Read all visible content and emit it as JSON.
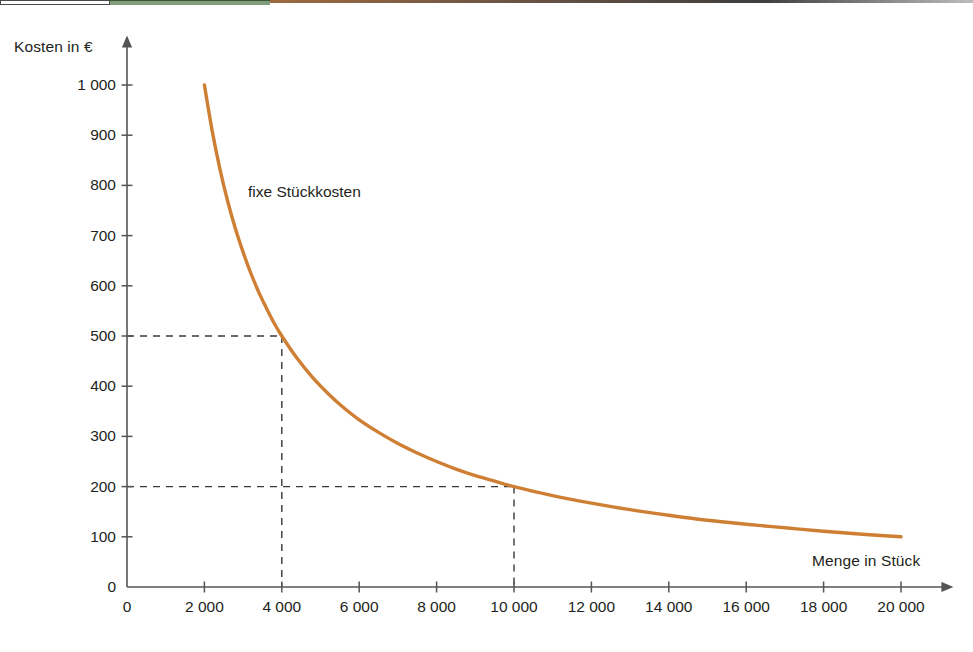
{
  "top_strip": {
    "segments": [
      {
        "name": "white-box",
        "color": "#fefefe"
      },
      {
        "name": "green-band",
        "color": "#7f9d78"
      },
      {
        "name": "brown-band",
        "color": "#9e6a3f"
      }
    ]
  },
  "chart_data": {
    "type": "line",
    "title": "",
    "subtitle": "",
    "xlabel": "Menge in Stück",
    "ylabel": "Kosten in €",
    "xlim": [
      0,
      20000
    ],
    "ylim": [
      0,
      1000
    ],
    "grid": false,
    "legend_position": "inline-annotation",
    "annotations": [
      {
        "name": "series-label",
        "text": "fixe Stückkosten",
        "x": 3400,
        "y": 760
      }
    ],
    "guide_lines": [
      {
        "name": "guide-500-at-4000",
        "x": 4000,
        "y": 500,
        "style": "dashed"
      },
      {
        "name": "guide-200-at-10000",
        "x": 10000,
        "y": 200,
        "style": "dashed"
      }
    ],
    "xticks": [
      0,
      2000,
      4000,
      6000,
      8000,
      10000,
      12000,
      14000,
      16000,
      18000,
      20000
    ],
    "xticklabels": [
      "0",
      "2 000",
      "4 000",
      "6 000",
      "8 000",
      "10 000",
      "12 000",
      "14 000",
      "16 000",
      "18 000",
      "20 000"
    ],
    "yticks": [
      0,
      100,
      200,
      300,
      400,
      500,
      600,
      700,
      800,
      900,
      1000
    ],
    "yticklabels": [
      "0",
      "100",
      "200",
      "300",
      "400",
      "500",
      "600",
      "700",
      "800",
      "900",
      "1 000"
    ],
    "series": [
      {
        "name": "fixe Stückkosten",
        "color": "#cf7f33",
        "formula_fixed_cost": 2000000,
        "x": [
          2000,
          2200,
          2400,
          2600,
          2800,
          3000,
          3200,
          3400,
          3600,
          3800,
          4000,
          4400,
          4800,
          5200,
          5600,
          6000,
          6500,
          7000,
          7500,
          8000,
          8500,
          9000,
          9500,
          10000,
          11000,
          12000,
          13000,
          14000,
          15000,
          16000,
          17000,
          18000,
          19000,
          20000
        ],
        "y": [
          1000,
          909,
          833,
          769,
          714,
          667,
          625,
          588,
          556,
          526,
          500,
          455,
          417,
          385,
          357,
          333,
          308,
          286,
          267,
          250,
          235,
          222,
          211,
          200,
          182,
          167,
          154,
          143,
          133,
          125,
          118,
          111,
          105,
          100
        ]
      }
    ]
  },
  "axes": {
    "x_arrow": true,
    "y_arrow": true,
    "axis_color": "#555555"
  }
}
